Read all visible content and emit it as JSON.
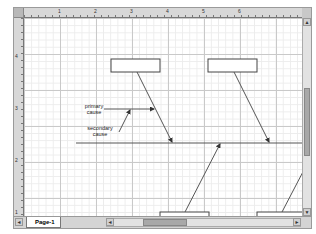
{
  "window": {
    "title": "Cause and Effect Diagram"
  },
  "rulers": {
    "horizontal_labels": [
      "1",
      "2",
      "3",
      "4",
      "5",
      "6"
    ],
    "vertical_labels": [
      "4",
      "3",
      "2",
      "1"
    ]
  },
  "diagram": {
    "labels": {
      "primary_cause": "primary\ncause",
      "primary_line1": "primary",
      "primary_line2": "cause",
      "secondary_line1": "secondary",
      "secondary_line2": "cause"
    },
    "category_boxes": [
      {
        "position": "top-left",
        "text": ""
      },
      {
        "position": "top-right",
        "text": ""
      },
      {
        "position": "bottom-left",
        "text": ""
      },
      {
        "position": "bottom-right",
        "text": ""
      }
    ],
    "colors": {
      "line": "#555555",
      "box_border": "#444444",
      "box_fill": "#ffffff"
    }
  },
  "footer": {
    "page_tab": "Page-1",
    "nav_first": "◄",
    "nav_last": "►"
  },
  "scrollbars": {
    "up_arrow": "▲",
    "down_arrow": "▼",
    "left_arrow": "◄",
    "right_arrow": "►"
  }
}
